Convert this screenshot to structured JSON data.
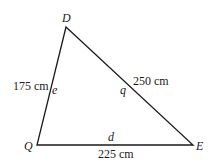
{
  "diagram": {
    "type": "triangle",
    "vertices": [
      {
        "name": "D",
        "x": 66,
        "y": 27
      },
      {
        "name": "Q",
        "x": 37,
        "y": 145
      },
      {
        "name": "E",
        "x": 193,
        "y": 145
      }
    ],
    "sides": [
      {
        "from": "D",
        "to": "Q",
        "label": "e",
        "length": "175 cm"
      },
      {
        "from": "D",
        "to": "E",
        "label": "q",
        "length": "250 cm"
      },
      {
        "from": "Q",
        "to": "E",
        "label": "d",
        "length": "225 cm"
      }
    ]
  },
  "labels": {
    "vertex_d": "D",
    "vertex_q": "Q",
    "vertex_e": "E",
    "side_e": "e",
    "side_q": "q",
    "side_d": "d",
    "len_de_q": "175 cm",
    "len_dq": "250 cm",
    "len_qe": "225 cm"
  },
  "colors": {
    "stroke": "#1a1a1a",
    "background": "#ffffff"
  }
}
